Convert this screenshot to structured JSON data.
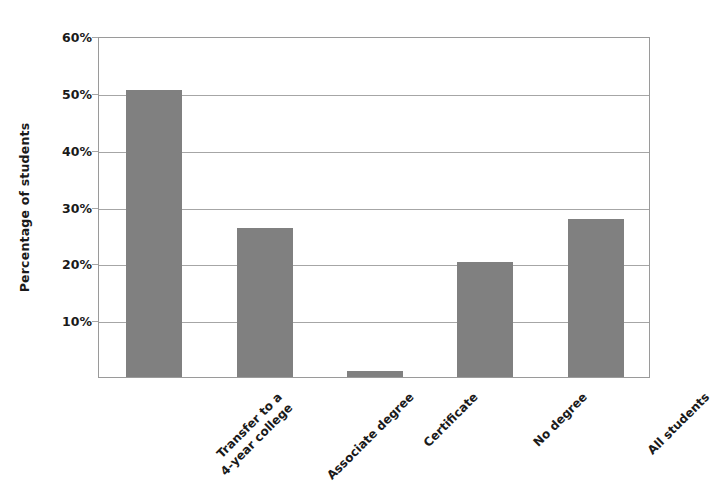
{
  "chart_data": {
    "type": "bar",
    "title": "",
    "xlabel": "",
    "ylabel": "Percentage of students",
    "categories": [
      "Transfer to a\n4-year college",
      "Associate degree",
      "Certificate",
      "No degree",
      "All students"
    ],
    "category_lines": [
      [
        "Transfer to a",
        "4-year college"
      ],
      [
        "Associate degree"
      ],
      [
        "Certificate"
      ],
      [
        "No degree"
      ],
      [
        "All students"
      ]
    ],
    "values": [
      50.5,
      26.2,
      1.0,
      20.3,
      27.8
    ],
    "value_labels": [
      "50.5%",
      "26.2%",
      "1.0%",
      "20.3%",
      "27.8%"
    ],
    "ylim": [
      0,
      60
    ],
    "ytick_values": [
      10,
      20,
      30,
      40,
      50,
      60
    ],
    "ytick_labels": [
      "10%",
      "20%",
      "30%",
      "40%",
      "50%",
      "60%"
    ],
    "grid": true,
    "legend": false,
    "bar_color": "#808080",
    "gridline_color": "#a6a6a6",
    "axis_color": "#9a9a9a",
    "text_color": "#1a1a1a"
  }
}
